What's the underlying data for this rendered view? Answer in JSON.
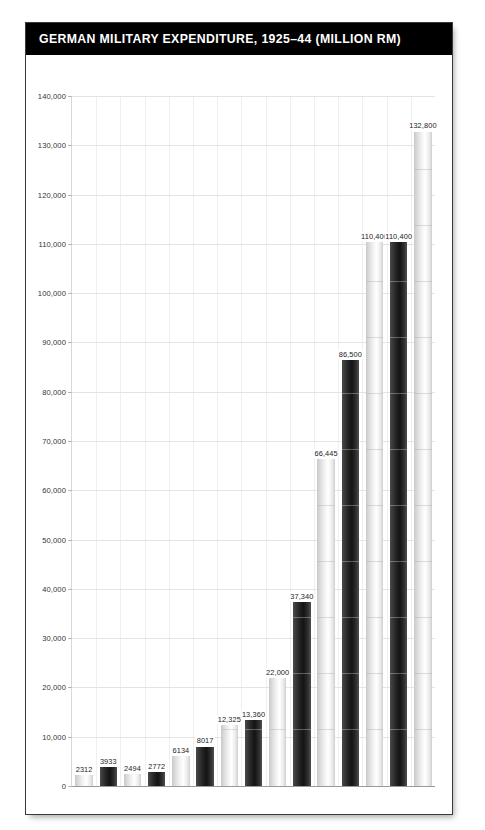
{
  "header": {
    "title": "GERMAN MILITARY EXPENDITURE, 1925–44 (MILLION RM)",
    "background_color": "#000000",
    "text_color": "#ffffff"
  },
  "chart_data": {
    "type": "bar",
    "title": "GERMAN MILITARY EXPENDITURE, 1925–44 (MILLION RM)",
    "xlabel": "",
    "ylabel": "",
    "ylim": [
      0,
      140000
    ],
    "ytick_step": 10000,
    "grid": true,
    "legend": "none",
    "categories": [
      "1925",
      "1930",
      "1932",
      "1933",
      "1934",
      "1935",
      "1936",
      "1937",
      "1938",
      "1939",
      "1940",
      "1941",
      "1942",
      "1943",
      "1944"
    ],
    "values": [
      2312,
      3933,
      2494,
      2772,
      6134,
      8017,
      12325,
      13360,
      22000,
      37340,
      66445,
      86500,
      110400,
      110400,
      132800
    ],
    "value_labels": [
      "2312",
      "3933",
      "2494",
      "2772",
      "6134",
      "8017",
      "12,325",
      "13,360",
      "22,000",
      "37,340",
      "66,445",
      "86,500",
      "110,400",
      "110,400",
      "132,800"
    ],
    "bar_shades": [
      "light",
      "dark",
      "light",
      "dark",
      "light",
      "dark",
      "light",
      "dark",
      "light",
      "dark",
      "light",
      "dark",
      "light",
      "dark",
      "light"
    ],
    "ytick_labels": [
      "0",
      "10,000",
      "20,000",
      "30,000",
      "40,000",
      "50,000",
      "60,000",
      "70,000",
      "80,000",
      "90,000",
      "100,000",
      "110,000",
      "120,000",
      "130,000",
      "140,000"
    ],
    "ytick_values": [
      0,
      10000,
      20000,
      30000,
      40000,
      50000,
      60000,
      70000,
      80000,
      90000,
      100000,
      110000,
      120000,
      130000,
      140000
    ],
    "colors": {
      "light_bar": "#e8e8e8",
      "dark_bar": "#242424",
      "gridline": "#e4e4e4",
      "axis": "#9a9a9a",
      "label_text": "#1b1b1b"
    }
  }
}
